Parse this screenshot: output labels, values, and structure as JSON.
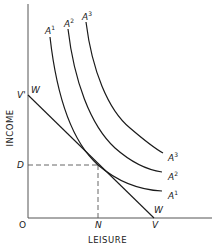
{
  "diagram": {
    "type": "indifference-curve-budget-line",
    "axes": {
      "x_label": "LEISURE",
      "y_label": "INCOME",
      "origin_label": "O"
    },
    "budget_line": {
      "start_label_axis": "V'",
      "start_label_line": "W",
      "end_label_axis": "V",
      "end_label_line": "W"
    },
    "equilibrium": {
      "income_label": "D",
      "leisure_label": "N"
    },
    "indifference_curves": [
      {
        "name": "A1",
        "base": "A",
        "sup": "1"
      },
      {
        "name": "A2",
        "base": "A",
        "sup": "2"
      },
      {
        "name": "A3",
        "base": "A",
        "sup": "3"
      }
    ],
    "colors": {
      "line": "#1a1a1a",
      "axis": "#555555",
      "dashed": "#555555",
      "background": "#ffffff"
    }
  }
}
